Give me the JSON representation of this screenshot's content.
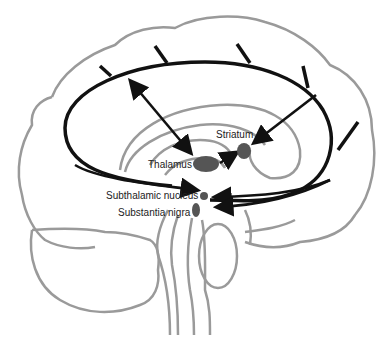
{
  "diagram": {
    "colors": {
      "outline": "#9a9a9a",
      "loop": "#111111",
      "nucleus": "#555555",
      "label": "#222222"
    },
    "labels": {
      "striatum": "Striatum",
      "thalamus": "Thalamus",
      "subthalamic_nucleus": "Subthalamic nucleus",
      "substantia_nigra": "Substantia nigra"
    },
    "structures": [
      "cerebral-cortex",
      "cortical-loop",
      "thalamus",
      "striatum",
      "subthalamic-nucleus",
      "substantia-nigra",
      "brainstem",
      "cerebellum"
    ],
    "connections": [
      {
        "from": "cortex",
        "to": "thalamus",
        "type": "bidirectional"
      },
      {
        "from": "cortex",
        "to": "striatum",
        "type": "arrow"
      },
      {
        "from": "thalamus",
        "to": "striatum",
        "type": "arrow"
      },
      {
        "from": "cortex",
        "to": "subthalamic-nucleus",
        "type": "arrow"
      },
      {
        "from": "cortex",
        "to": "substantia-nigra",
        "type": "arrow"
      }
    ]
  }
}
